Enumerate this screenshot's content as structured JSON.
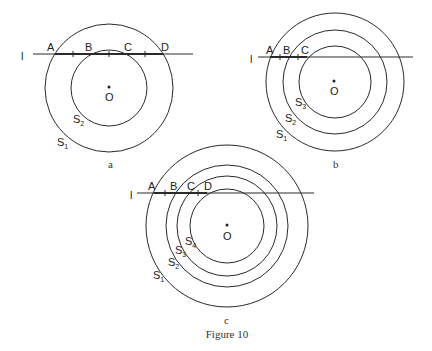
{
  "figure": {
    "caption": "Figure 10",
    "panels": [
      {
        "id": "a",
        "label": "a",
        "center_label": "O",
        "line_label": "l",
        "circles": [
          {
            "name": "S",
            "sub": "1"
          },
          {
            "name": "S",
            "sub": "2"
          }
        ],
        "points": [
          "A",
          "B",
          "C",
          "D"
        ]
      },
      {
        "id": "b",
        "label": "b",
        "center_label": "O",
        "line_label": "l",
        "circles": [
          {
            "name": "S",
            "sub": "1"
          },
          {
            "name": "S",
            "sub": "2"
          },
          {
            "name": "S",
            "sub": "3"
          }
        ],
        "points": [
          "A",
          "B",
          "C"
        ]
      },
      {
        "id": "c",
        "label": "c",
        "center_label": "O",
        "line_label": "l",
        "circles": [
          {
            "name": "S",
            "sub": "1"
          },
          {
            "name": "S",
            "sub": "2"
          },
          {
            "name": "S",
            "sub": "3"
          },
          {
            "name": "S",
            "sub": "4"
          }
        ],
        "points": [
          "A",
          "B",
          "C",
          "D"
        ]
      }
    ]
  }
}
